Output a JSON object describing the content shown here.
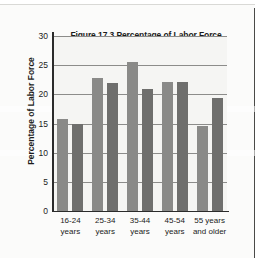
{
  "chart_data": {
    "type": "bar",
    "title": "Figure 17.3 Percentage of Labor Force by Age Group",
    "title_line1": "Figure 17.3 Percentage of Labor Force",
    "title_line2": "by Age Group",
    "xlabel": "",
    "ylabel": "Percentage of Labor Force",
    "ylim": [
      0,
      30
    ],
    "yticks": [
      30,
      25,
      20,
      15,
      10,
      5,
      0
    ],
    "grid": true,
    "legend_position": "top-right",
    "categories": [
      "16-24 years",
      "25-34 years",
      "35-44 years",
      "45-54 years",
      "55 years and older"
    ],
    "category_lines": [
      [
        "16-24",
        "years"
      ],
      [
        "25-34",
        "years"
      ],
      [
        "35-44",
        "years"
      ],
      [
        "45-54",
        "years"
      ],
      [
        "55 years",
        "and older"
      ]
    ],
    "series": [
      {
        "name": "2001",
        "color": "#8a8a88",
        "values": [
          15.7,
          22.8,
          25.6,
          22.1,
          14.5
        ]
      },
      {
        "name": "2011",
        "color": "#6f6f6d",
        "values": [
          15.0,
          21.9,
          20.9,
          22.1,
          19.4
        ]
      }
    ]
  }
}
